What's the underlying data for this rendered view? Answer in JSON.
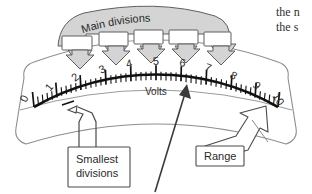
{
  "figure": {
    "kind": "analog-voltmeter-scale-diagram",
    "background_color": "#ffffff",
    "line_color": "#3a3a3a",
    "scale_color": "#111111",
    "banner_fill": "#d4d4d4"
  },
  "banner": {
    "label": "Main divisions",
    "pointer_count": 5,
    "points_to": [
      2,
      3,
      4,
      5,
      6
    ]
  },
  "gauge": {
    "unit_label": "Volts",
    "range_min": 0,
    "range_max": 10,
    "major_ticks": [
      0,
      1,
      2,
      3,
      4,
      5,
      6,
      7,
      8,
      9,
      10
    ],
    "tick_labels": [
      "0",
      "1",
      "2",
      "3",
      "4",
      "5",
      "6",
      "7",
      "8",
      "9",
      "10"
    ],
    "minor_per_major": 5
  },
  "callouts": [
    {
      "id": "smallest-divisions",
      "line1": "Smallest",
      "line2": "divisions"
    },
    {
      "id": "range",
      "line1": "Range",
      "line2": ""
    }
  ],
  "pointer_arrow": {
    "name": "needle-indicator-arrow",
    "points_to_value": 6
  },
  "body_text": {
    "line1": "the n",
    "line2": "the s"
  }
}
